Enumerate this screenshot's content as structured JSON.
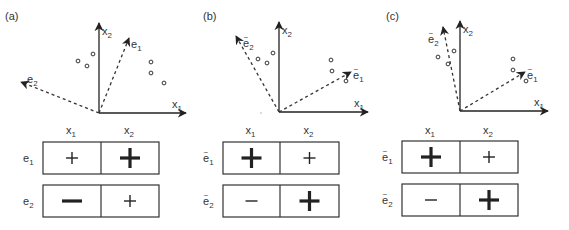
{
  "panels": [
    {
      "id": "a",
      "label": "(a)",
      "tilde": false,
      "origin": [
        99,
        113
      ],
      "axes": {
        "x1_end": [
          186,
          113
        ],
        "x2_end": [
          99,
          23
        ],
        "x1_label": "x",
        "x1_sub": "1",
        "x2_label": "x",
        "x2_sub": "2"
      },
      "vectors": [
        {
          "name": "e",
          "sub": "1",
          "tip": [
            129,
            38
          ],
          "label_pos": [
            131,
            48
          ]
        },
        {
          "name": "e",
          "sub": "2",
          "tip": [
            21,
            82
          ],
          "label_pos": [
            27,
            83
          ]
        }
      ],
      "points": [
        [
          78,
          61
        ],
        [
          87,
          66
        ],
        [
          93,
          54
        ],
        [
          151,
          62
        ],
        [
          151,
          73
        ],
        [
          164,
          83
        ]
      ],
      "table": {
        "x": 43,
        "divider": 101,
        "right": 159,
        "col_headers": [
          {
            "t": "x",
            "s": "1"
          },
          {
            "t": "x",
            "s": "2"
          }
        ],
        "rows": [
          {
            "label": "e",
            "sub": "1",
            "y": 142,
            "cells": [
              {
                "sign": "+",
                "size": "small"
              },
              {
                "sign": "+",
                "size": "large"
              }
            ]
          },
          {
            "label": "e",
            "sub": "2",
            "y": 185,
            "cells": [
              {
                "sign": "−",
                "size": "large"
              },
              {
                "sign": "+",
                "size": "small"
              }
            ]
          }
        ]
      }
    },
    {
      "id": "b",
      "label": "(b)",
      "tilde": true,
      "origin": [
        279,
        112
      ],
      "axes": {
        "x1_end": [
          368,
          112
        ],
        "x2_end": [
          279,
          22
        ],
        "x1_label": "x",
        "x1_sub": "1",
        "x2_label": "x",
        "x2_sub": "2"
      },
      "vectors": [
        {
          "name": "e",
          "sub": "1",
          "tip": [
            351,
            72
          ],
          "label_pos": [
            353,
            79
          ]
        },
        {
          "name": "e",
          "sub": "2",
          "tip": [
            236,
            36
          ],
          "label_pos": [
            243,
            47
          ]
        }
      ],
      "points": [
        [
          258,
          59
        ],
        [
          267,
          63
        ],
        [
          273,
          53
        ],
        [
          331,
          60
        ],
        [
          332,
          71
        ],
        [
          346,
          81
        ]
      ],
      "table": {
        "x": 223,
        "divider": 280,
        "right": 339,
        "col_headers": [
          {
            "t": "x",
            "s": "1"
          },
          {
            "t": "x",
            "s": "2"
          }
        ],
        "rows": [
          {
            "label": "e",
            "sub": "1",
            "y": 142,
            "cells": [
              {
                "sign": "+",
                "size": "large"
              },
              {
                "sign": "+",
                "size": "small"
              }
            ]
          },
          {
            "label": "e",
            "sub": "2",
            "y": 185,
            "cells": [
              {
                "sign": "−",
                "size": "small"
              },
              {
                "sign": "+",
                "size": "large"
              }
            ]
          }
        ]
      }
    },
    {
      "id": "c",
      "label": "(c)",
      "tilde": true,
      "origin": [
        460,
        111
      ],
      "axes": {
        "x1_end": [
          548,
          111
        ],
        "x2_end": [
          460,
          21
        ],
        "x1_label": "x",
        "x1_sub": "1",
        "x2_label": "x",
        "x2_sub": "2"
      },
      "vectors": [
        {
          "name": "e",
          "sub": "1",
          "tip": [
            525,
            72
          ],
          "label_pos": [
            527,
            79
          ]
        },
        {
          "name": "e",
          "sub": "2",
          "tip": [
            443,
            27
          ],
          "label_pos": [
            428,
            43
          ]
        }
      ],
      "points": [
        [
          438,
          57
        ],
        [
          448,
          64
        ],
        [
          454,
          51
        ],
        [
          513,
          59
        ],
        [
          513,
          70
        ],
        [
          526,
          81
        ]
      ],
      "table": {
        "x": 402,
        "divider": 460,
        "right": 518,
        "col_headers": [
          {
            "t": "x",
            "s": "1"
          },
          {
            "t": "x",
            "s": "2"
          }
        ],
        "rows": [
          {
            "label": "e",
            "sub": "1",
            "y": 141,
            "cells": [
              {
                "sign": "+",
                "size": "large"
              },
              {
                "sign": "+",
                "size": "small"
              }
            ]
          },
          {
            "label": "e",
            "sub": "2",
            "y": 184,
            "cells": [
              {
                "sign": "−",
                "size": "small"
              },
              {
                "sign": "+",
                "size": "large"
              }
            ]
          }
        ]
      }
    }
  ],
  "panel_label_pos": {
    "a": [
      5,
      20
    ],
    "b": [
      203,
      20
    ],
    "c": [
      386,
      20
    ]
  },
  "stray_dot": [
    261,
    113
  ],
  "colors": {
    "ink": "#222222",
    "box": "#333333",
    "dash": "#333333"
  }
}
